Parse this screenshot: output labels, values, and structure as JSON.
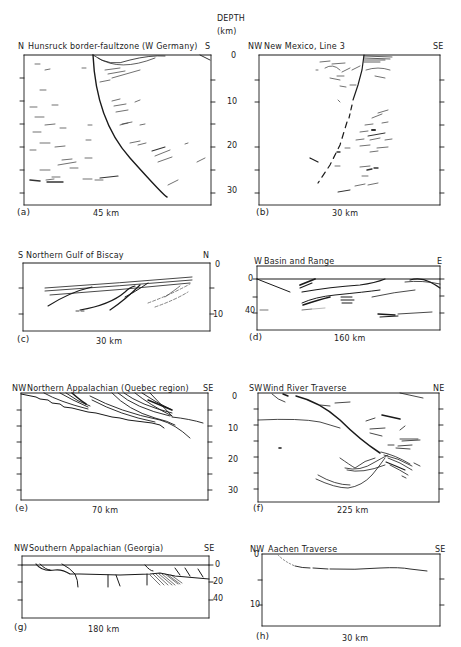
{
  "figure": {
    "depth_header": "DEPTH",
    "depth_unit": "(km)",
    "panels": [
      {
        "id": "a",
        "letter": "(a)",
        "left": "N",
        "title": "Hunsruck border-faultzone (W Germany)",
        "right": "S",
        "scale": "45 km",
        "depth_ticks": [
          "0",
          "10",
          "20",
          "30"
        ]
      },
      {
        "id": "b",
        "letter": "(b)",
        "left": "NW",
        "title": "New Mexico, Line 3",
        "right": "SE",
        "scale": "30 km",
        "depth_ticks": [
          "0",
          "10",
          "20",
          "30"
        ]
      },
      {
        "id": "c",
        "letter": "(c)",
        "left": "S",
        "title": "Northern  Gulf of Biscay",
        "right": "N",
        "scale": "30 km",
        "depth_ticks": [
          "0",
          "10"
        ]
      },
      {
        "id": "d",
        "letter": "(d)",
        "left": "W",
        "title": "Basin  and  Range",
        "right": "E",
        "scale": "160 km",
        "depth_ticks": [
          "0",
          "40"
        ]
      },
      {
        "id": "e",
        "letter": "(e)",
        "left": "NW",
        "title": "Northern  Appalachian  (Quebec region)",
        "right": "SE",
        "scale": "70 km",
        "depth_ticks": [
          "0",
          "10",
          "20",
          "30"
        ]
      },
      {
        "id": "f",
        "letter": "(f)",
        "left": "SW",
        "title": "Wind  River  Traverse",
        "right": "NE",
        "scale": "225 km",
        "depth_ticks": [
          "0",
          "10",
          "20",
          "30"
        ]
      },
      {
        "id": "g",
        "letter": "(g)",
        "left": "NW",
        "title": "Southern  Appalachian  (Georgia)",
        "right": "SE",
        "scale": "180 km",
        "depth_ticks": [
          "0",
          "20",
          "40"
        ]
      },
      {
        "id": "h",
        "letter": "(h)",
        "left": "NW",
        "title": "Aachen  Traverse",
        "right": "SE",
        "scale": "30 km",
        "depth_ticks": [
          "0",
          "10"
        ]
      }
    ]
  }
}
